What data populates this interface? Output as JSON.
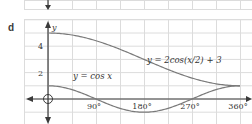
{
  "figure": {
    "part_label": "d"
  },
  "chart_data": {
    "type": "line",
    "title": "",
    "xlabel": "x",
    "ylabel": "y",
    "x_ticks": [
      {
        "value": 90,
        "label": "90°"
      },
      {
        "value": 180,
        "label": "180°"
      },
      {
        "value": 270,
        "label": "270°"
      },
      {
        "value": 360,
        "label": "360°"
      }
    ],
    "y_ticks": [
      {
        "value": 2,
        "label": "2"
      },
      {
        "value": 4,
        "label": "4"
      }
    ],
    "xlim": [
      -30,
      380
    ],
    "ylim": [
      -1.5,
      6
    ],
    "grid": true,
    "series": [
      {
        "name": "y = 2cos(x/2) + 3",
        "label": "y = 2cos(x/2) + 3",
        "expression": "2*cos(x/2)+3",
        "x": [
          0,
          45,
          90,
          135,
          180,
          225,
          270,
          315,
          360
        ],
        "values": [
          5,
          4.85,
          4.41,
          3.77,
          3,
          2.23,
          1.59,
          1.15,
          1
        ]
      },
      {
        "name": "y = cos x",
        "label": "y = cos x",
        "expression": "cos(x)",
        "x": [
          0,
          45,
          90,
          135,
          180,
          225,
          270,
          315,
          360
        ],
        "values": [
          1,
          0.71,
          0,
          -0.71,
          -1,
          -0.71,
          0,
          0.71,
          1
        ]
      }
    ],
    "annotations": [
      {
        "text": "y = 2cos(x/2) + 3",
        "near_x": 200,
        "near_y": 3.0
      },
      {
        "text": "y = cos x",
        "near_x": 60,
        "near_y": 1.6
      }
    ],
    "colors": {
      "curve": "#7a7a7a",
      "axis": "#3a3a3a",
      "grid": "#dcdcdc"
    }
  }
}
